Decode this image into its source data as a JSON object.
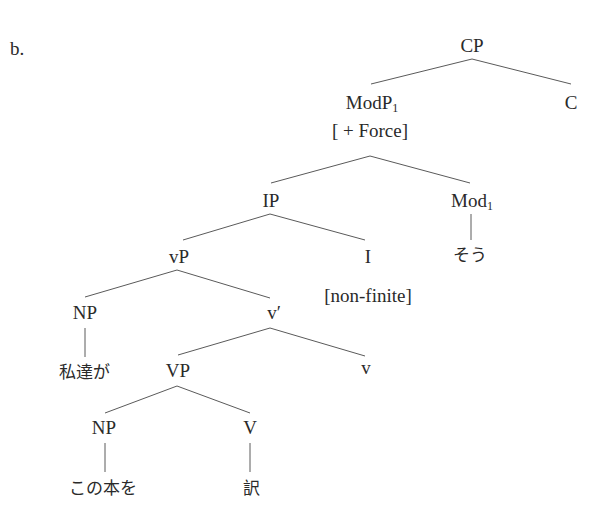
{
  "example_label": "b.",
  "tree": {
    "cp": "CP",
    "modp": "ModP",
    "modp_sub": "1",
    "c": "C",
    "force": "[ + Force]",
    "ip": "IP",
    "mod": "Mod",
    "mod_sub": "1",
    "sou": "そう",
    "vp_small": "vP",
    "i": "I",
    "nonfinite": "[non-finite]",
    "np_subject": "NP",
    "vbar": "v′",
    "subject_word": "私達が",
    "vp": "VP",
    "v_small": "v",
    "np_object": "NP",
    "v": "V",
    "object_word": "この本を",
    "verb_word": "訳"
  },
  "colors": {
    "text": "#2a2a2a",
    "lines": "#5a5a5a",
    "background": "#ffffff"
  }
}
